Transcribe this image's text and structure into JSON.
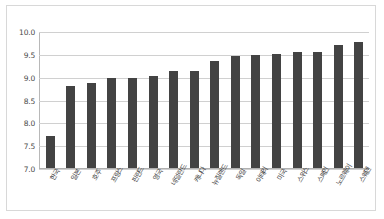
{
  "chart_data": {
    "type": "bar",
    "title": "",
    "subtitle": "",
    "xlabel": "",
    "ylabel": "",
    "ylim": [
      7.0,
      10.0
    ],
    "ytick_step": 0.5,
    "ytick_labels": [
      "10.0",
      "9.5",
      "9.0",
      "8.5",
      "8.0",
      "7.5",
      "7.0"
    ],
    "ytick_values": [
      10.0,
      9.5,
      9.0,
      8.5,
      8.0,
      7.5,
      7.0
    ],
    "grid": true,
    "legend": null,
    "legend_position": "none",
    "bar_color": "#434343",
    "gridline_color": "#d0d0d0",
    "background_color": "#ffffff",
    "border_color": "#d8d8d8",
    "categories": [
      "한국",
      "일본",
      "호주",
      "프랑스",
      "핀란드",
      "영국",
      "네덜란드",
      "캐나다",
      "뉴질랜드",
      "독일",
      "이태리",
      "미국",
      "스위스",
      "스페인",
      "노르웨이",
      "스웨덴"
    ],
    "values": [
      7.71,
      8.81,
      8.88,
      8.99,
      8.99,
      9.03,
      9.15,
      9.15,
      9.36,
      9.46,
      9.5,
      9.52,
      9.55,
      9.57,
      9.71,
      9.78
    ],
    "series": [
      {
        "name": "",
        "values": [
          7.71,
          8.81,
          8.88,
          8.99,
          8.99,
          9.03,
          9.15,
          9.15,
          9.36,
          9.46,
          9.5,
          9.52,
          9.55,
          9.57,
          9.71,
          9.78
        ]
      }
    ],
    "annotations": []
  }
}
